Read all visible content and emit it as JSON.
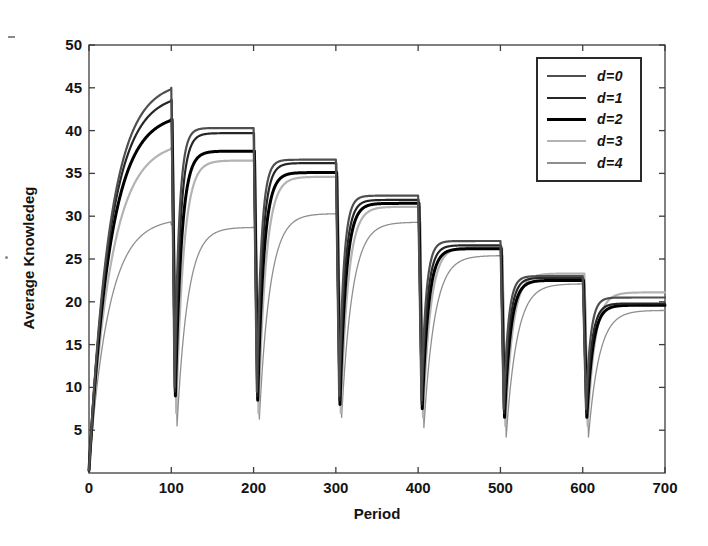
{
  "chart_data": {
    "type": "line",
    "title": "",
    "xlabel": "Period",
    "ylabel": "Average Knowledeg",
    "xlim": [
      0,
      700
    ],
    "ylim": [
      0,
      50
    ],
    "x_ticks": [
      0,
      100,
      200,
      300,
      400,
      500,
      600,
      700
    ],
    "y_ticks": [
      5,
      10,
      15,
      20,
      25,
      30,
      35,
      40,
      45,
      50
    ],
    "grid": false,
    "legend_position": "top-right",
    "frame_color": "#3c3c3c",
    "text_color": "#141414",
    "tick_length": 6,
    "shock_period": 100,
    "num_segments": 7,
    "series": [
      {
        "name": "d=0",
        "color": "#4f4f4f",
        "width": 2.2,
        "start": 0.3,
        "rise_tau": 26,
        "recover_tau": 5.5,
        "drop_offset": 0,
        "plateaus": [
          45.0,
          40.3,
          36.6,
          32.4,
          27.1,
          23.0,
          20.5
        ],
        "shock_minima": [
          10.0,
          9.5,
          9.0,
          8.5,
          7.5,
          7.5
        ]
      },
      {
        "name": "d=1",
        "color": "#262626",
        "width": 2.2,
        "start": 0.3,
        "rise_tau": 26,
        "recover_tau": 6.5,
        "drop_offset": 0.5,
        "plateaus": [
          43.6,
          39.7,
          36.2,
          31.9,
          26.6,
          22.8,
          19.8
        ],
        "shock_minima": [
          9.5,
          9.0,
          8.5,
          8.0,
          7.0,
          7.0
        ]
      },
      {
        "name": "d=2",
        "color": "#000000",
        "width": 3.0,
        "start": 0.3,
        "rise_tau": 26,
        "recover_tau": 7.5,
        "drop_offset": 1,
        "plateaus": [
          41.3,
          37.6,
          35.1,
          31.5,
          26.2,
          22.5,
          19.6
        ],
        "shock_minima": [
          9.0,
          8.5,
          8.0,
          7.5,
          6.5,
          6.5
        ]
      },
      {
        "name": "d=3",
        "color": "#b3b3b3",
        "width": 2.2,
        "start": 0.3,
        "rise_tau": 27,
        "recover_tau": 9,
        "drop_offset": 2,
        "plateaus": [
          38.0,
          36.5,
          34.6,
          31.1,
          26.4,
          23.3,
          21.1
        ],
        "shock_minima": [
          7.0,
          7.0,
          7.0,
          6.5,
          5.5,
          5.5
        ]
      },
      {
        "name": "d=4",
        "color": "#8f8f8f",
        "width": 1.3,
        "start": 0.3,
        "rise_tau": 24,
        "recover_tau": 13,
        "drop_offset": 3,
        "plateaus": [
          29.0,
          28.7,
          30.3,
          29.3,
          25.4,
          22.1,
          19.0
        ],
        "shock_minima": [
          5.5,
          6.3,
          6.5,
          5.3,
          4.2,
          4.2
        ]
      }
    ],
    "draw_order": [
      4,
      3,
      2,
      1,
      0
    ],
    "plot_box_px": {
      "left": 89,
      "right": 665,
      "top": 45,
      "bottom": 473
    }
  }
}
